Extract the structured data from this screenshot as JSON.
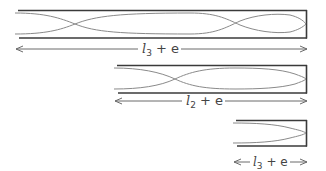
{
  "diagram": {
    "colors": {
      "wall": "#3a3a3a",
      "wave": "#8a8a8a",
      "arrow": "#6a6a6a",
      "text": "#444444"
    },
    "tubes": [
      {
        "id": "tube-3",
        "label_symbol": "l",
        "label_subscript": "3",
        "label_suffix": "+ e",
        "half_wavelengths": 5
      },
      {
        "id": "tube-2",
        "label_symbol": "l",
        "label_subscript": "2",
        "label_suffix": "+ e",
        "half_wavelengths": 3
      },
      {
        "id": "tube-1",
        "label_symbol": "l",
        "label_subscript": "3",
        "label_suffix": "+ e",
        "half_wavelengths": 1
      }
    ]
  }
}
